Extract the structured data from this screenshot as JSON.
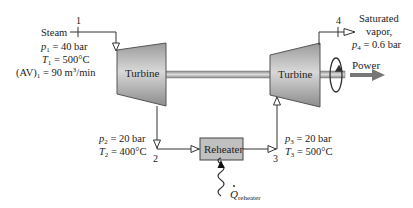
{
  "diagram": {
    "components": {
      "turbine1": {
        "label": "Turbine"
      },
      "turbine2": {
        "label": "Turbine"
      },
      "reheater": {
        "label": "Reheater"
      }
    },
    "states": {
      "s1": {
        "number": "1",
        "name": "Steam",
        "p_sym": "p",
        "p_sub": "1",
        "p_val": " = 40 bar",
        "t_sym": "T",
        "t_sub": "1",
        "t_val": " = 500°C",
        "av_pre": "(AV)",
        "av_sub": "1",
        "av_val": " = 90 m",
        "av_sup": "3",
        "av_unit": "/min"
      },
      "s2": {
        "number": "2",
        "p_sym": "p",
        "p_sub": "2",
        "p_val": " = 20 bar",
        "t_sym": "T",
        "t_sub": "2",
        "t_val": " = 400°C"
      },
      "s3": {
        "number": "3",
        "p_sym": "p",
        "p_sub": "3",
        "p_val": " = 20 bar",
        "t_sym": "T",
        "t_sub": "3",
        "t_val": " = 500°C"
      },
      "s4": {
        "number": "4",
        "line1": "Saturated",
        "line2": "vapor,",
        "p_sym": "p",
        "p_sub": "4",
        "p_val": " = 0.6 bar"
      }
    },
    "power": {
      "label": "Power"
    },
    "heat": {
      "sym": "Q",
      "sub": "reheater"
    }
  }
}
